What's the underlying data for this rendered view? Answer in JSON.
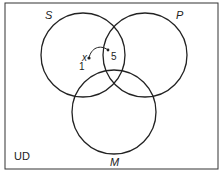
{
  "diagram": {
    "type": "venn",
    "universe_label": "UD",
    "sets": [
      {
        "name": "S",
        "cx": 83,
        "cy": 55,
        "r": 42
      },
      {
        "name": "P",
        "cx": 145,
        "cy": 55,
        "r": 42
      },
      {
        "name": "M",
        "cx": 114,
        "cy": 112,
        "r": 42
      }
    ],
    "annotations": {
      "point_label": "x",
      "region_a": "1",
      "region_b": "5"
    },
    "colors": {
      "stroke": "#222222",
      "background": "#ffffff"
    }
  }
}
